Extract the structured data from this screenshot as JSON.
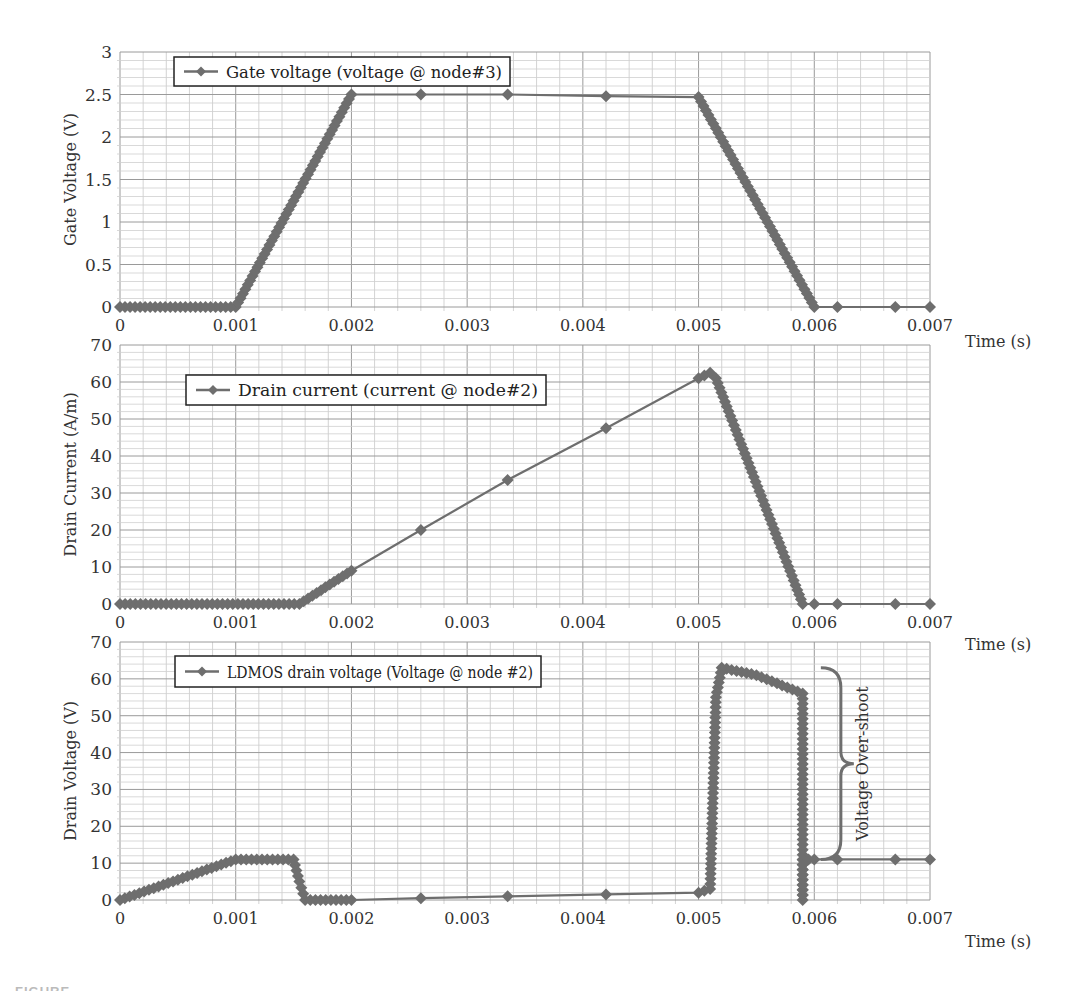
{
  "figure": {
    "caption_partial": "FIGURE"
  },
  "chart_data": [
    {
      "type": "line",
      "title": "",
      "xlabel": "Time (s)",
      "ylabel": "Gate Voltage (V)",
      "xlim": [
        0,
        0.007
      ],
      "ylim": [
        0,
        3
      ],
      "x_ticks": [
        "0",
        "0.001",
        "0.002",
        "0.003",
        "0.004",
        "0.005",
        "0.006",
        "0.007"
      ],
      "y_ticks": [
        "0",
        "0.5",
        "1",
        "1.5",
        "2",
        "2.5",
        "3"
      ],
      "grid": true,
      "legend": {
        "position": "upper-left",
        "entries": [
          "Gate voltage (voltage @ node#3)"
        ]
      },
      "series": [
        {
          "name": "Gate voltage (voltage @ node#3)",
          "color": "#6e6e6e",
          "marker": "diamond",
          "x": [
            0,
            0.001,
            0.002,
            0.0026,
            0.00335,
            0.0042,
            0.005,
            0.006,
            0.0062,
            0.0067,
            0.007
          ],
          "y": [
            0,
            0,
            2.5,
            2.5,
            2.5,
            2.48,
            2.47,
            0,
            0,
            0,
            0
          ],
          "dense_segments": [
            [
              0,
              0.001
            ],
            [
              0.001,
              0.002
            ],
            [
              0.005,
              0.006
            ]
          ]
        }
      ]
    },
    {
      "type": "line",
      "title": "",
      "xlabel": "Time (s)",
      "ylabel": "Drain Current (A/m)",
      "xlim": [
        0,
        0.007
      ],
      "ylim": [
        0,
        70
      ],
      "x_ticks": [
        "0",
        "0.001",
        "0.002",
        "0.003",
        "0.004",
        "0.005",
        "0.006",
        "0.007"
      ],
      "y_ticks": [
        "0",
        "10",
        "20",
        "30",
        "40",
        "50",
        "60",
        "70"
      ],
      "grid": true,
      "legend": {
        "position": "upper-left",
        "entries": [
          "Drain current (current @ node#2)"
        ]
      },
      "series": [
        {
          "name": "Drain current (current @ node#2)",
          "color": "#6e6e6e",
          "marker": "diamond",
          "x": [
            0,
            0.00155,
            0.002,
            0.0026,
            0.00335,
            0.0042,
            0.005,
            0.0051,
            0.00515,
            0.0059,
            0.006,
            0.0062,
            0.0067,
            0.007
          ],
          "y": [
            0,
            0,
            9,
            20,
            33.5,
            47.5,
            61,
            62.5,
            61,
            0,
            0,
            0,
            0,
            0
          ],
          "dense_segments": [
            [
              0,
              0.00155
            ],
            [
              0.00155,
              0.002
            ],
            [
              0.005,
              0.0059
            ]
          ]
        }
      ]
    },
    {
      "type": "line",
      "title": "",
      "xlabel": "Time (s)",
      "ylabel": "Drain Voltage (V)",
      "xlim": [
        0,
        0.007
      ],
      "ylim": [
        0,
        70
      ],
      "x_ticks": [
        "0",
        "0.001",
        "0.002",
        "0.003",
        "0.004",
        "0.005",
        "0.006",
        "0.007"
      ],
      "y_ticks": [
        "0",
        "10",
        "20",
        "30",
        "40",
        "50",
        "60",
        "70"
      ],
      "grid": true,
      "legend": {
        "position": "upper-left",
        "entries": [
          "LDMOS drain voltage (Voltage @ node #2)"
        ]
      },
      "annotations": [
        {
          "text": "Voltage Over-shoot",
          "type": "curly-brace",
          "x": 0.0061,
          "y_range": [
            11,
            63
          ]
        }
      ],
      "series": [
        {
          "name": "LDMOS drain voltage (Voltage @ node #2)",
          "color": "#6e6e6e",
          "marker": "diamond",
          "x": [
            0,
            0.001,
            0.0015,
            0.00155,
            0.0016,
            0.002,
            0.0026,
            0.00335,
            0.0042,
            0.005,
            0.0051,
            0.00515,
            0.0052,
            0.0055,
            0.0059,
            0.0059,
            0.0059,
            0.006,
            0.0062,
            0.0067,
            0.007
          ],
          "y": [
            0,
            11,
            11,
            5,
            0,
            0,
            0.5,
            1,
            1.5,
            2,
            3,
            55,
            63,
            61,
            56,
            0,
            11,
            11,
            11,
            11,
            11
          ],
          "dense_segments": [
            [
              0,
              0.00155
            ],
            [
              0.00155,
              0.002
            ],
            [
              0.005,
              0.006
            ]
          ]
        }
      ]
    }
  ]
}
